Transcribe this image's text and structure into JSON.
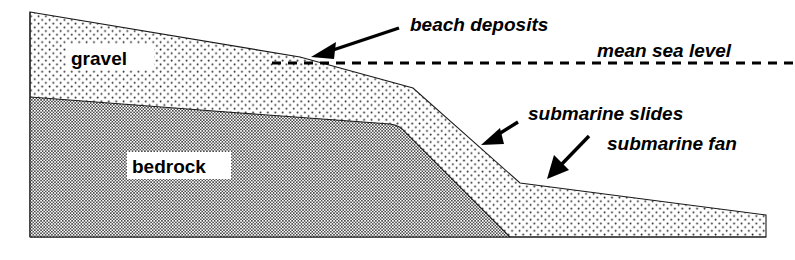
{
  "figure": {
    "type": "geological-cross-section",
    "background_color": "#ffffff",
    "ink_color": "#000000"
  },
  "units": [
    {
      "id": "gravel",
      "label": "gravel",
      "pattern": "sparse-dot-stipple",
      "description": "subaerial gravel wedge above bedrock"
    },
    {
      "id": "bedrock",
      "label": "bedrock",
      "pattern": "dense-checkerboard-hatch",
      "description": "basal bedrock wedge tapering seaward"
    }
  ],
  "annotations": [
    {
      "id": "beach-deposits",
      "label": "beach deposits",
      "arrow": "points down-left to shoreline platform"
    },
    {
      "id": "mean-sea-level",
      "label": "mean sea level",
      "line_style": "dashed horizontal"
    },
    {
      "id": "submarine-slides",
      "label": "submarine slides",
      "arrow": "points down-left to steep submarine slope"
    },
    {
      "id": "submarine-fan",
      "label": "submarine fan",
      "arrow": "points down-left to basin-floor fan"
    }
  ],
  "geometry": {
    "left_edge_x": 30,
    "right_edge_x": 766,
    "baseline_y": 237,
    "sea_level_y": 63,
    "gravel_crest_y": 12,
    "shoreline_x": 300,
    "slope_break_x": 413,
    "fan_apex_x": 520,
    "bedrock_toe_x": 510
  }
}
